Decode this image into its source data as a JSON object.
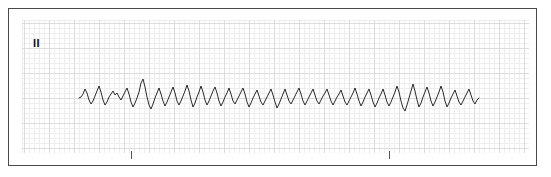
{
  "strip": {
    "lead_label": "II",
    "trace_color": "#2b2b2b",
    "grid_major_color": "#dcdcdc",
    "grid_minor_color": "#eeeeee",
    "border_color": "#4a4a4a",
    "paper_background": "#ffffff"
  },
  "interval_markers": [
    {
      "name": "interval-tick-1",
      "x_px": 130
    },
    {
      "name": "interval-tick-2",
      "x_px": 388
    }
  ],
  "chart_data": {
    "type": "line",
    "title": "",
    "xlabel": "",
    "ylabel": "",
    "series_name": "Lead II",
    "grid": true,
    "legend": "none",
    "baseline_y": 97,
    "xlim": [
      78,
      478
    ],
    "ylim": [
      74,
      114
    ],
    "trace_start_x": 78,
    "trace_end_x": 478,
    "rhythm_description": "irregularly irregular polymorphic complexes, variable amplitude and R-R intervals",
    "points": [
      [
        78,
        97
      ],
      [
        80,
        96
      ],
      [
        82,
        93
      ],
      [
        84,
        88
      ],
      [
        86,
        92
      ],
      [
        88,
        99
      ],
      [
        90,
        103
      ],
      [
        92,
        100
      ],
      [
        94,
        95
      ],
      [
        96,
        90
      ],
      [
        98,
        85
      ],
      [
        100,
        91
      ],
      [
        102,
        99
      ],
      [
        104,
        104
      ],
      [
        106,
        101
      ],
      [
        108,
        96
      ],
      [
        110,
        93
      ],
      [
        112,
        90
      ],
      [
        114,
        94
      ],
      [
        116,
        92
      ],
      [
        118,
        96
      ],
      [
        120,
        99
      ],
      [
        122,
        95
      ],
      [
        124,
        91
      ],
      [
        126,
        87
      ],
      [
        128,
        93
      ],
      [
        130,
        101
      ],
      [
        132,
        106
      ],
      [
        134,
        102
      ],
      [
        136,
        97
      ],
      [
        138,
        91
      ],
      [
        140,
        82
      ],
      [
        142,
        78
      ],
      [
        144,
        86
      ],
      [
        146,
        96
      ],
      [
        148,
        104
      ],
      [
        150,
        108
      ],
      [
        152,
        103
      ],
      [
        154,
        97
      ],
      [
        156,
        92
      ],
      [
        158,
        87
      ],
      [
        160,
        93
      ],
      [
        162,
        100
      ],
      [
        164,
        105
      ],
      [
        166,
        101
      ],
      [
        168,
        96
      ],
      [
        170,
        91
      ],
      [
        172,
        86
      ],
      [
        174,
        92
      ],
      [
        176,
        100
      ],
      [
        178,
        104
      ],
      [
        180,
        100
      ],
      [
        182,
        95
      ],
      [
        184,
        90
      ],
      [
        186,
        84
      ],
      [
        188,
        90
      ],
      [
        190,
        99
      ],
      [
        192,
        106
      ],
      [
        194,
        102
      ],
      [
        196,
        96
      ],
      [
        198,
        91
      ],
      [
        200,
        85
      ],
      [
        202,
        91
      ],
      [
        204,
        99
      ],
      [
        206,
        104
      ],
      [
        208,
        100
      ],
      [
        210,
        95
      ],
      [
        212,
        90
      ],
      [
        214,
        86
      ],
      [
        216,
        92
      ],
      [
        218,
        100
      ],
      [
        220,
        105
      ],
      [
        222,
        101
      ],
      [
        224,
        96
      ],
      [
        226,
        92
      ],
      [
        228,
        87
      ],
      [
        230,
        93
      ],
      [
        232,
        100
      ],
      [
        234,
        103
      ],
      [
        236,
        99
      ],
      [
        238,
        95
      ],
      [
        240,
        91
      ],
      [
        242,
        87
      ],
      [
        244,
        93
      ],
      [
        246,
        101
      ],
      [
        248,
        106
      ],
      [
        250,
        102
      ],
      [
        252,
        97
      ],
      [
        254,
        93
      ],
      [
        256,
        89
      ],
      [
        258,
        95
      ],
      [
        260,
        101
      ],
      [
        262,
        104
      ],
      [
        264,
        100
      ],
      [
        266,
        96
      ],
      [
        268,
        92
      ],
      [
        270,
        88
      ],
      [
        272,
        94
      ],
      [
        274,
        101
      ],
      [
        276,
        107
      ],
      [
        278,
        103
      ],
      [
        280,
        98
      ],
      [
        282,
        93
      ],
      [
        284,
        88
      ],
      [
        286,
        94
      ],
      [
        288,
        100
      ],
      [
        290,
        103
      ],
      [
        292,
        99
      ],
      [
        294,
        95
      ],
      [
        296,
        91
      ],
      [
        298,
        87
      ],
      [
        300,
        93
      ],
      [
        302,
        100
      ],
      [
        304,
        104
      ],
      [
        306,
        100
      ],
      [
        308,
        96
      ],
      [
        310,
        92
      ],
      [
        312,
        88
      ],
      [
        314,
        94
      ],
      [
        316,
        100
      ],
      [
        318,
        103
      ],
      [
        320,
        99
      ],
      [
        322,
        95
      ],
      [
        324,
        92
      ],
      [
        326,
        88
      ],
      [
        328,
        94
      ],
      [
        330,
        100
      ],
      [
        332,
        104
      ],
      [
        334,
        100
      ],
      [
        336,
        96
      ],
      [
        338,
        93
      ],
      [
        340,
        89
      ],
      [
        342,
        95
      ],
      [
        344,
        101
      ],
      [
        346,
        104
      ],
      [
        348,
        100
      ],
      [
        350,
        96
      ],
      [
        352,
        92
      ],
      [
        354,
        87
      ],
      [
        356,
        93
      ],
      [
        358,
        100
      ],
      [
        360,
        105
      ],
      [
        362,
        101
      ],
      [
        364,
        96
      ],
      [
        366,
        92
      ],
      [
        368,
        88
      ],
      [
        370,
        94
      ],
      [
        372,
        101
      ],
      [
        374,
        106
      ],
      [
        376,
        102
      ],
      [
        378,
        97
      ],
      [
        380,
        93
      ],
      [
        382,
        88
      ],
      [
        384,
        94
      ],
      [
        386,
        101
      ],
      [
        388,
        105
      ],
      [
        390,
        101
      ],
      [
        392,
        96
      ],
      [
        394,
        91
      ],
      [
        396,
        85
      ],
      [
        398,
        91
      ],
      [
        400,
        100
      ],
      [
        402,
        107
      ],
      [
        404,
        110
      ],
      [
        406,
        104
      ],
      [
        408,
        97
      ],
      [
        410,
        90
      ],
      [
        412,
        83
      ],
      [
        414,
        90
      ],
      [
        416,
        99
      ],
      [
        418,
        106
      ],
      [
        420,
        102
      ],
      [
        422,
        96
      ],
      [
        424,
        91
      ],
      [
        426,
        86
      ],
      [
        428,
        92
      ],
      [
        430,
        100
      ],
      [
        432,
        105
      ],
      [
        434,
        101
      ],
      [
        436,
        96
      ],
      [
        438,
        91
      ],
      [
        440,
        85
      ],
      [
        442,
        91
      ],
      [
        444,
        100
      ],
      [
        446,
        106
      ],
      [
        448,
        102
      ],
      [
        450,
        97
      ],
      [
        452,
        93
      ],
      [
        454,
        89
      ],
      [
        456,
        95
      ],
      [
        458,
        101
      ],
      [
        460,
        104
      ],
      [
        462,
        100
      ],
      [
        464,
        96
      ],
      [
        466,
        92
      ],
      [
        468,
        88
      ],
      [
        470,
        94
      ],
      [
        472,
        100
      ],
      [
        474,
        103
      ],
      [
        476,
        99
      ],
      [
        478,
        97
      ]
    ]
  }
}
